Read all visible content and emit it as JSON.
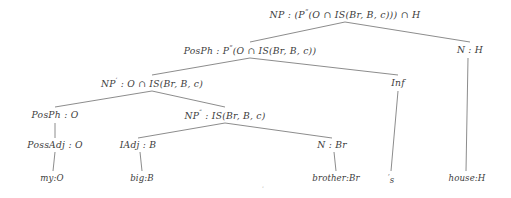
{
  "figure": {
    "name": "syntactic-parse-tree",
    "background_color": "#ffffff",
    "edge_color": "#6e6e6e",
    "text_color": "#3c3c3c",
    "width": 511,
    "height": 198
  },
  "nodes": [
    {
      "id": "root",
      "name": "node-np-root",
      "label": "NP : (P“(O ∩ IS(Br, B, c))) ∩ H",
      "category": "NP",
      "semantics": "(P“(O ∩ IS(Br, B, c))) ∩ H",
      "x": 345,
      "y": 14,
      "level": 0
    },
    {
      "id": "posph1",
      "name": "node-posph-upper",
      "label": "PosPh : P“(O ∩ IS(Br, B, c))",
      "category": "PosPh",
      "semantics": "P“(O ∩ IS(Br, B, c))",
      "x": 250,
      "y": 50,
      "level": 1
    },
    {
      "id": "nh",
      "name": "node-n-h",
      "label": "N : H",
      "category": "N",
      "semantics": "H",
      "x": 470,
      "y": 50,
      "level": 1
    },
    {
      "id": "npprime",
      "name": "node-np-prime",
      "label": "NP′ : O ∩ IS(Br, B, c)",
      "category": "NP′",
      "semantics": "O ∩ IS(Br, B, c)",
      "x": 152,
      "y": 83,
      "level": 2
    },
    {
      "id": "inf",
      "name": "node-inf",
      "label": "Inf",
      "category": "Inf",
      "semantics": "",
      "x": 398,
      "y": 83,
      "level": 2
    },
    {
      "id": "posph2",
      "name": "node-posph-lower",
      "label": "PosPh : O",
      "category": "PosPh",
      "semantics": "O",
      "x": 55,
      "y": 115,
      "level": 3
    },
    {
      "id": "npdprime",
      "name": "node-np-double-prime",
      "label": "NP″ : IS(Br, B, c)",
      "category": "NP″",
      "semantics": "IS(Br, B, c)",
      "x": 225,
      "y": 115,
      "level": 3
    },
    {
      "id": "possadj",
      "name": "node-possadj",
      "label": "PossAdj : O",
      "category": "PossAdj",
      "semantics": "O",
      "x": 55,
      "y": 145,
      "level": 4
    },
    {
      "id": "iadj",
      "name": "node-iadj",
      "label": "IAdj : B",
      "category": "IAdj",
      "semantics": "B",
      "x": 138,
      "y": 145,
      "level": 4
    },
    {
      "id": "nbr",
      "name": "node-n-br",
      "label": "N : Br",
      "category": "N",
      "semantics": "Br",
      "x": 332,
      "y": 145,
      "level": 4
    }
  ],
  "leaves": [
    {
      "id": "leaf-my",
      "name": "leaf-my",
      "label": "my:O",
      "word": "my",
      "semantics": "O",
      "x": 52,
      "y": 178
    },
    {
      "id": "leaf-big",
      "name": "leaf-big",
      "label": "big:B",
      "word": "big",
      "semantics": "B",
      "x": 142,
      "y": 178
    },
    {
      "id": "leaf-brother",
      "name": "leaf-brother",
      "label": "brother:Br",
      "word": "brother",
      "semantics": "Br",
      "x": 336,
      "y": 178
    },
    {
      "id": "leaf-s",
      "name": "leaf-possessive-s",
      "label": "’s",
      "word": "’s",
      "semantics": "",
      "x": 391,
      "y": 179
    },
    {
      "id": "leaf-house",
      "name": "leaf-house",
      "label": "house:H",
      "word": "house",
      "semantics": "H",
      "x": 467,
      "y": 178
    }
  ],
  "edges": [
    {
      "name": "edge-root-to-posph-upper",
      "x1": 345,
      "y1": 22,
      "x2": 250,
      "y2": 42
    },
    {
      "name": "edge-root-to-n-h",
      "x1": 345,
      "y1": 22,
      "x2": 470,
      "y2": 42
    },
    {
      "name": "edge-posph-upper-to-np-prime",
      "x1": 250,
      "y1": 58,
      "x2": 152,
      "y2": 75
    },
    {
      "name": "edge-posph-upper-to-inf",
      "x1": 250,
      "y1": 58,
      "x2": 398,
      "y2": 75
    },
    {
      "name": "edge-np-prime-to-posph-lower",
      "x1": 152,
      "y1": 91,
      "x2": 55,
      "y2": 107
    },
    {
      "name": "edge-np-prime-to-np-double-prime",
      "x1": 152,
      "y1": 91,
      "x2": 225,
      "y2": 107
    },
    {
      "name": "edge-np-double-prime-to-iadj",
      "x1": 225,
      "y1": 123,
      "x2": 138,
      "y2": 138
    },
    {
      "name": "edge-np-double-prime-to-n-br",
      "x1": 225,
      "y1": 123,
      "x2": 332,
      "y2": 138
    },
    {
      "name": "edge-posph-lower-to-possadj",
      "x1": 55,
      "y1": 123,
      "x2": 55,
      "y2": 138
    },
    {
      "name": "edge-possadj-to-my",
      "x1": 55,
      "y1": 152,
      "x2": 53,
      "y2": 171
    },
    {
      "name": "edge-iadj-to-big",
      "x1": 140,
      "y1": 152,
      "x2": 142,
      "y2": 171
    },
    {
      "name": "edge-n-br-to-brother",
      "x1": 334,
      "y1": 152,
      "x2": 336,
      "y2": 171
    },
    {
      "name": "edge-inf-to-possessive-s",
      "x1": 398,
      "y1": 91,
      "x2": 391,
      "y2": 171
    },
    {
      "name": "edge-n-h-to-house",
      "x1": 468,
      "y1": 58,
      "x2": 466,
      "y2": 171
    }
  ],
  "artifacts": [
    {
      "name": "stray-ink-mark",
      "label": "ʹ",
      "x": 263,
      "y": 190
    }
  ]
}
